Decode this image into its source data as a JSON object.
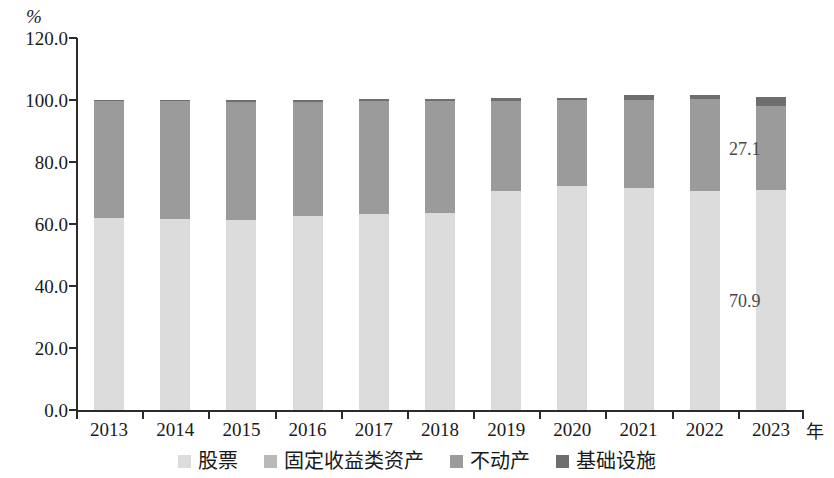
{
  "chart_data": {
    "type": "bar",
    "subtype": "stacked-bar",
    "title": "",
    "xlabel": "年",
    "ylabel": "%",
    "ylim": [
      0,
      120
    ],
    "ytick_step": 20,
    "yticks": [
      "120.0",
      "100.0",
      "80.0",
      "60.0",
      "40.0",
      "20.0",
      "0.0"
    ],
    "grid": false,
    "legend_position": "bottom",
    "categories": [
      "2013",
      "2014",
      "2015",
      "2016",
      "2017",
      "2018",
      "2019",
      "2020",
      "2021",
      "2022",
      "2023"
    ],
    "series": [
      {
        "name": "股票",
        "color": "#dcdcdc",
        "values": [
          62.0,
          61.5,
          61.3,
          62.6,
          63.3,
          63.7,
          70.6,
          72.3,
          71.6,
          70.6,
          70.9
        ]
      },
      {
        "name": "固定收益类资产",
        "color": "#b9b9b9",
        "values": [
          0,
          0,
          0,
          0,
          0,
          0,
          0,
          0,
          0,
          0,
          0
        ]
      },
      {
        "name": "不动产",
        "color": "#9b9b9b",
        "values": [
          37.6,
          38.1,
          38.2,
          36.9,
          36.4,
          36.1,
          29.2,
          27.6,
          28.3,
          29.6,
          27.1
        ]
      },
      {
        "name": "基础设施",
        "color": "#6e6e6e",
        "values": [
          0.4,
          0.4,
          0.5,
          0.5,
          0.5,
          0.6,
          0.7,
          0.8,
          1.6,
          1.4,
          3.1
        ]
      }
    ],
    "data_labels": [
      {
        "text": "27.1",
        "category": "2023",
        "series": "不动产"
      },
      {
        "text": "70.9",
        "category": "2023",
        "series": "股票"
      }
    ]
  },
  "legend": {
    "items": [
      {
        "label": "股票"
      },
      {
        "label": "固定收益类资产"
      },
      {
        "label": "不动产"
      },
      {
        "label": "基础设施"
      }
    ]
  }
}
